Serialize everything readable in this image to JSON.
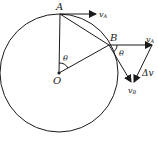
{
  "diagram": {
    "type": "circular-motion-velocity-change",
    "colors": {
      "stroke": "#1a1a1a",
      "background": "#ffffff"
    },
    "labels": {
      "point_a": "A",
      "point_b": "B",
      "center": "O",
      "angle_at_center": "θ",
      "angle_at_b": "θ",
      "velocity_a": "v",
      "velocity_a_sub": "A",
      "velocity_a_copy": "v",
      "velocity_a_copy_sub": "A",
      "velocity_b": "v",
      "velocity_b_sub": "B",
      "delta_v": "Δv"
    }
  }
}
